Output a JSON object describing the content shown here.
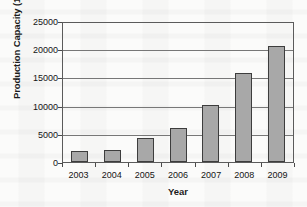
{
  "chart_data": {
    "type": "bar",
    "title": "",
    "subtitle": "",
    "xlabel": "Year",
    "ylabel": "Production Capacity (10³ ton)",
    "ylabel_base": "Production Capacity (10",
    "ylabel_exponent": "3",
    "ylabel_suffix": " ton)",
    "categories": [
      "2003",
      "2004",
      "2005",
      "2006",
      "2007",
      "2008",
      "2009"
    ],
    "values": [
      2000,
      2100,
      4200,
      6000,
      10100,
      15800,
      20600
    ],
    "series": [
      {
        "name": "Production Capacity",
        "values": [
          2000,
          2100,
          4200,
          6000,
          10100,
          15800,
          20600
        ]
      }
    ],
    "ylim": [
      0,
      25000
    ],
    "ytick_values": [
      0,
      5000,
      10000,
      15000,
      20000,
      25000
    ],
    "ytick_labels": [
      "0",
      "5000",
      "10000",
      "15000",
      "20000",
      "25000"
    ],
    "grid": "horizontal",
    "legend": "none",
    "bar_color": "#a8a8a8",
    "bar_border_color": "#3d3d3d",
    "axis_color": "#5b5b5b",
    "gridline_color": "#777777",
    "text_color": "#141414",
    "background_color": "#ffffff"
  }
}
